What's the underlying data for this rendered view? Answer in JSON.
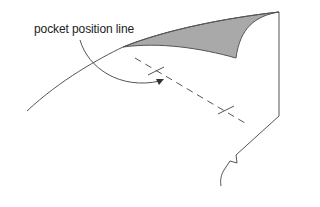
{
  "diagram": {
    "type": "technical-illustration",
    "label": "pocket position line",
    "colors": {
      "line": "#555555",
      "shade": "#a9a9a9",
      "text": "#222222"
    },
    "elements": [
      {
        "name": "panel-outline",
        "kind": "solid-line"
      },
      {
        "name": "folded-corner",
        "kind": "shaded-region"
      },
      {
        "name": "pocket-position-line",
        "kind": "dashed-line"
      },
      {
        "name": "placement-marks",
        "kind": "cross-marks",
        "count": 2
      },
      {
        "name": "leader-arrow",
        "kind": "curved-arrow"
      }
    ]
  }
}
